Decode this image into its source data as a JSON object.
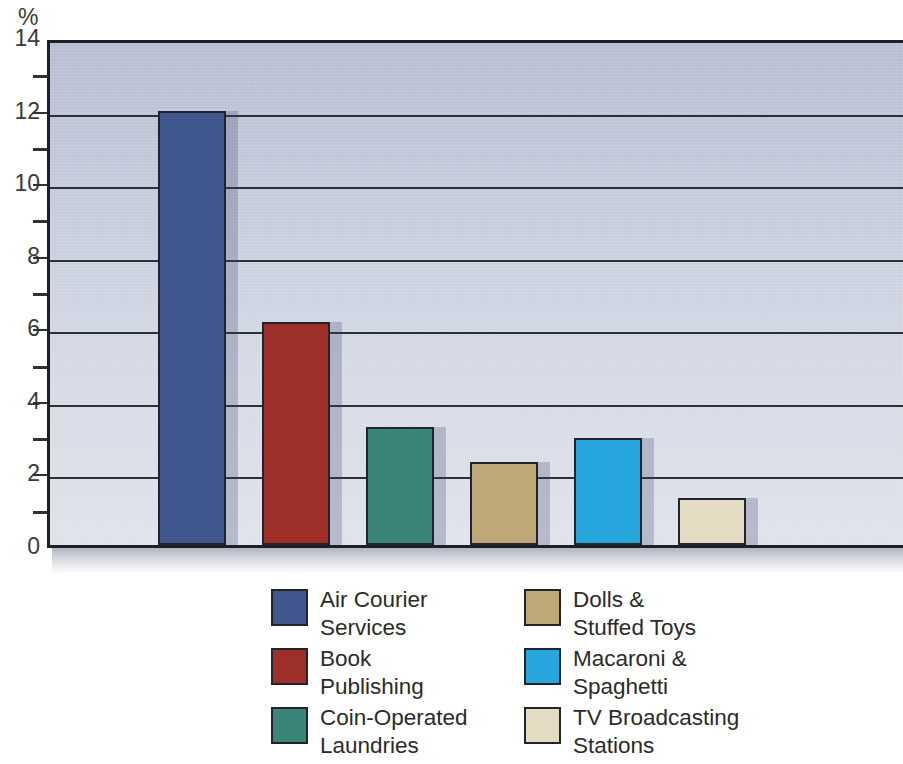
{
  "chart_data": {
    "type": "bar",
    "title": "",
    "xlabel": "",
    "ylabel": "%",
    "ylim": [
      0,
      14
    ],
    "ytick_step": 2,
    "yticks": [
      "0",
      "2",
      "4",
      "6",
      "8",
      "10",
      "12",
      "14"
    ],
    "minor_ticks": [
      1,
      3,
      5,
      7,
      9,
      11,
      13
    ],
    "grid": true,
    "legend_position": "bottom",
    "categories": [
      "Air Courier Services",
      "Book Publishing",
      "Coin-Operated Laundries",
      "Dolls & Stuffed Toys",
      "Macaroni & Spaghetti",
      "TV Broadcasting Stations"
    ],
    "values": [
      11.95,
      6.15,
      3.25,
      2.3,
      2.95,
      1.3
    ],
    "colors": [
      "#40588f",
      "#9e3029",
      "#3b8479",
      "#bfa878",
      "#26a6dc",
      "#e5ddc3"
    ]
  },
  "axis": {
    "unit_label": "%",
    "tick_labels": [
      "14",
      "12",
      "10",
      "8",
      "6",
      "4",
      "2",
      "0"
    ]
  },
  "legend": {
    "left_column": [
      {
        "label": "Air Courier\nServices",
        "color": "#40588f",
        "swatch_name": "legend-swatch-air-courier-services"
      },
      {
        "label": "Book\nPublishing",
        "color": "#9e3029",
        "swatch_name": "legend-swatch-book-publishing"
      },
      {
        "label": "Coin-Operated\nLaundries",
        "color": "#3b8479",
        "swatch_name": "legend-swatch-coin-operated-laundries"
      }
    ],
    "right_column": [
      {
        "label": "Dolls &\nStuffed Toys",
        "color": "#bfa878",
        "swatch_name": "legend-swatch-dolls-stuffed-toys"
      },
      {
        "label": "Macaroni &\nSpaghetti",
        "color": "#26a6dc",
        "swatch_name": "legend-swatch-macaroni-spaghetti"
      },
      {
        "label": "TV Broadcasting\nStations",
        "color": "#e5ddc3",
        "swatch_name": "legend-swatch-tv-broadcasting-stations"
      }
    ]
  },
  "plot_style": {
    "background_top": "#b5bdd2",
    "background_bottom": "#dfe2ea",
    "gridline_color": "#2d3039",
    "axis_color": "#1d1f26",
    "bar_border": "#22242b",
    "bar_shadow": "rgba(60,70,110,0.26)"
  }
}
